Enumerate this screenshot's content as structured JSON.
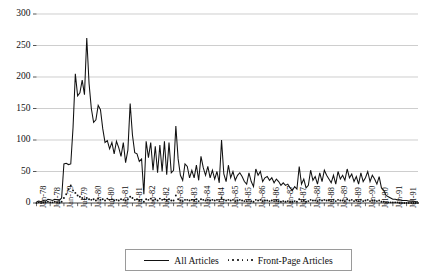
{
  "chart_data": {
    "type": "line",
    "title": "",
    "subtitle": "",
    "xlabel": "",
    "ylabel": "",
    "ylim": [
      0,
      300
    ],
    "yticks": [
      0,
      50,
      100,
      150,
      200,
      250,
      300
    ],
    "ytick_labels": [
      "0",
      "50",
      "100",
      "150",
      "200",
      "250",
      "300"
    ],
    "grid": "horizontal",
    "legend_position": "bottom-center",
    "x_start": "Jan-78",
    "x_end": "Dec-91",
    "x": [
      "Jan-78",
      "Feb-78",
      "Mar-78",
      "Apr-78",
      "May-78",
      "Jun-78",
      "Jul-78",
      "Aug-78",
      "Sep-78",
      "Oct-78",
      "Nov-78",
      "Dec-78",
      "Jan-79",
      "Feb-79",
      "Mar-79",
      "Apr-79",
      "May-79",
      "Jun-79",
      "Jul-79",
      "Aug-79",
      "Sep-79",
      "Oct-79",
      "Nov-79",
      "Dec-79",
      "Jan-80",
      "Feb-80",
      "Mar-80",
      "Apr-80",
      "May-80",
      "Jun-80",
      "Jul-80",
      "Aug-80",
      "Sep-80",
      "Oct-80",
      "Nov-80",
      "Dec-80",
      "Jan-81",
      "Feb-81",
      "Mar-81",
      "Apr-81",
      "May-81",
      "Jun-81",
      "Jul-81",
      "Aug-81",
      "Sep-81",
      "Oct-81",
      "Nov-81",
      "Dec-81",
      "Jan-82",
      "Feb-82",
      "Mar-82",
      "Apr-82",
      "May-82",
      "Jun-82",
      "Jul-82",
      "Aug-82",
      "Sep-82",
      "Oct-82",
      "Nov-82",
      "Dec-82",
      "Jan-83",
      "Feb-83",
      "Mar-83",
      "Apr-83",
      "May-83",
      "Jun-83",
      "Jul-83",
      "Aug-83",
      "Sep-83",
      "Oct-83",
      "Nov-83",
      "Dec-83",
      "Jan-84",
      "Feb-84",
      "Mar-84",
      "Apr-84",
      "May-84",
      "Jun-84",
      "Jul-84",
      "Aug-84",
      "Sep-84",
      "Oct-84",
      "Nov-84",
      "Dec-84",
      "Jan-85",
      "Feb-85",
      "Mar-85",
      "Apr-85",
      "May-85",
      "Jun-85",
      "Jul-85",
      "Aug-85",
      "Sep-85",
      "Oct-85",
      "Nov-85",
      "Dec-85",
      "Jan-86",
      "Feb-86",
      "Mar-86",
      "Apr-86",
      "May-86",
      "Jun-86",
      "Jul-86",
      "Aug-86",
      "Sep-86",
      "Oct-86",
      "Nov-86",
      "Dec-86",
      "Jan-87",
      "Feb-87",
      "Mar-87",
      "Apr-87",
      "May-87",
      "Jun-87",
      "Jul-87",
      "Aug-87",
      "Sep-87",
      "Oct-87",
      "Nov-87",
      "Dec-87",
      "Jan-88",
      "Feb-88",
      "Mar-88",
      "Apr-88",
      "May-88",
      "Jun-88",
      "Jul-88",
      "Aug-88",
      "Sep-88",
      "Oct-88",
      "Nov-88",
      "Dec-88",
      "Jan-89",
      "Feb-89",
      "Mar-89",
      "Apr-89",
      "May-89",
      "Jun-89",
      "Jul-89",
      "Aug-89",
      "Sep-89",
      "Oct-89",
      "Nov-89",
      "Dec-89",
      "Jan-90",
      "Feb-90",
      "Mar-90",
      "Apr-90",
      "May-90",
      "Jun-90",
      "Jul-90",
      "Aug-90",
      "Sep-90",
      "Oct-90",
      "Nov-90",
      "Dec-90",
      "Jan-91",
      "Feb-91",
      "Mar-91",
      "Apr-91",
      "May-91",
      "Jun-91",
      "Jul-91",
      "Aug-91",
      "Sep-91",
      "Oct-91",
      "Nov-91",
      "Dec-91"
    ],
    "xtick_labels": [
      "Jan-78",
      "Jul-78",
      "Jan-79",
      "Jul-79",
      "Jan-80",
      "Jul-80",
      "Jan-81",
      "Jul-81",
      "Jan-82",
      "Jul-82",
      "Jan-83",
      "Jul-83",
      "Jan-84",
      "Jul-84",
      "Jan-85",
      "Jul-85",
      "Jan-86",
      "Jul-86",
      "Jan-87",
      "Jul-87",
      "Jan-88",
      "Jul-88",
      "Jan-89",
      "Jul-89",
      "Jan-90",
      "Jul-90",
      "Jan-91",
      "Jul-91"
    ],
    "series": [
      {
        "name": "All Articles",
        "style": "solid",
        "color": "#111111",
        "values": [
          2,
          3,
          2,
          4,
          3,
          6,
          5,
          4,
          6,
          5,
          4,
          8,
          62,
          63,
          61,
          62,
          120,
          205,
          170,
          175,
          195,
          172,
          262,
          190,
          150,
          128,
          132,
          155,
          148,
          118,
          96,
          99,
          86,
          96,
          78,
          98,
          88,
          74,
          96,
          64,
          84,
          158,
          108,
          80,
          78,
          66,
          70,
          14,
          98,
          72,
          96,
          52,
          90,
          48,
          92,
          50,
          98,
          45,
          96,
          48,
          52,
          122,
          70,
          44,
          36,
          62,
          58,
          40,
          52,
          40,
          60,
          36,
          74,
          56,
          44,
          58,
          40,
          52,
          38,
          50,
          32,
          100,
          46,
          34,
          60,
          40,
          50,
          36,
          44,
          48,
          42,
          34,
          30,
          48,
          34,
          26,
          54,
          44,
          50,
          34,
          40,
          42,
          36,
          40,
          32,
          38,
          34,
          28,
          32,
          28,
          30,
          24,
          20,
          26,
          22,
          58,
          30,
          38,
          24,
          28,
          52,
          36,
          42,
          30,
          48,
          34,
          52,
          44,
          38,
          32,
          44,
          30,
          50,
          38,
          44,
          36,
          54,
          40,
          46,
          34,
          42,
          30,
          48,
          34,
          40,
          50,
          34,
          44,
          38,
          30,
          42,
          24,
          20,
          12,
          10,
          8,
          6,
          6,
          5,
          5,
          4,
          4,
          4,
          3,
          3,
          3,
          2,
          2
        ]
      },
      {
        "name": "Front-Page Articles",
        "style": "dotted",
        "color": "#111111",
        "values": [
          0,
          1,
          0,
          1,
          1,
          2,
          1,
          1,
          2,
          1,
          1,
          2,
          8,
          14,
          22,
          28,
          20,
          16,
          12,
          10,
          8,
          6,
          8,
          6,
          5,
          6,
          4,
          7,
          5,
          6,
          4,
          7,
          5,
          6,
          4,
          5,
          4,
          6,
          5,
          4,
          6,
          10,
          8,
          5,
          6,
          4,
          5,
          2,
          6,
          5,
          7,
          4,
          6,
          4,
          7,
          5,
          6,
          4,
          6,
          4,
          4,
          12,
          6,
          4,
          3,
          5,
          5,
          4,
          5,
          4,
          6,
          3,
          6,
          5,
          4,
          5,
          4,
          5,
          4,
          5,
          3,
          8,
          5,
          4,
          5,
          4,
          5,
          3,
          4,
          5,
          4,
          3,
          3,
          5,
          3,
          2,
          5,
          4,
          5,
          3,
          4,
          4,
          3,
          4,
          3,
          4,
          3,
          2,
          3,
          2,
          3,
          2,
          2,
          3,
          2,
          6,
          3,
          4,
          2,
          3,
          5,
          4,
          4,
          3,
          5,
          4,
          5,
          4,
          4,
          3,
          5,
          3,
          5,
          4,
          4,
          3,
          6,
          4,
          5,
          3,
          4,
          3,
          5,
          3,
          4,
          5,
          3,
          4,
          4,
          3,
          4,
          2,
          2,
          1,
          1,
          1,
          1,
          1,
          1,
          0,
          0,
          0,
          0,
          0,
          0,
          0,
          0,
          0
        ]
      }
    ],
    "legend": [
      {
        "label": "All Articles",
        "style": "solid"
      },
      {
        "label": "Front-Page Articles",
        "style": "dotted"
      }
    ]
  },
  "legend": {
    "all_articles": "All Articles",
    "front_page_articles": "Front-Page Articles"
  }
}
